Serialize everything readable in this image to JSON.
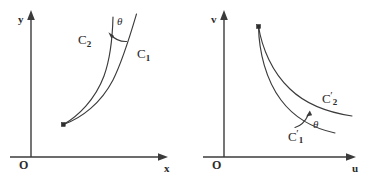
{
  "figure": {
    "background_color": "#ffffff",
    "ink_color": "#3b3b3b",
    "panels": [
      {
        "id": "left-panel",
        "axes": {
          "x_label": "x",
          "y_label": "y",
          "origin_label": "O"
        },
        "curves": [
          {
            "id": "c1",
            "label_text": "C",
            "label_sub": "1"
          },
          {
            "id": "c2",
            "label_text": "C",
            "label_sub": "2"
          }
        ],
        "angle_label": "θ",
        "angle_description": "angle theta between curve C1 and curve C2 at their upper region, arrow pointing from C1 toward C2"
      },
      {
        "id": "right-panel",
        "axes": {
          "x_label": "u",
          "y_label": "v",
          "origin_label": "O"
        },
        "curves": [
          {
            "id": "c1p",
            "label_text": "C",
            "label_prime": "′",
            "label_sub": "1"
          },
          {
            "id": "c2p",
            "label_text": "C",
            "label_prime": "′",
            "label_sub": "2"
          }
        ],
        "angle_label": "θ",
        "angle_description": "angle theta between curve C1-prime and curve C2-prime, arrow pointing from C1-prime up toward C2-prime"
      }
    ]
  }
}
